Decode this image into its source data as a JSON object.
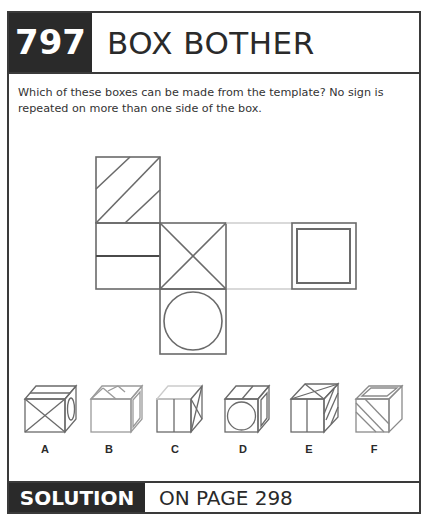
{
  "header": {
    "puzzle_number": "797",
    "title": "BOX BOTHER"
  },
  "question": "Which of these boxes can be made from the template? No sign is repeated on more than one side of the box.",
  "template": {
    "faces": [
      {
        "position": "top-left",
        "symbol": "diagonal-stripes"
      },
      {
        "position": "middle-left",
        "symbol": "horizontal-line"
      },
      {
        "position": "center",
        "symbol": "x-cross"
      },
      {
        "position": "middle-right",
        "symbol": "blank"
      },
      {
        "position": "far-right",
        "symbol": "double-square"
      },
      {
        "position": "bottom-center",
        "symbol": "circle"
      }
    ]
  },
  "options": [
    {
      "label": "A",
      "front": "x-cross",
      "top": "horizontal-line",
      "side": "circle"
    },
    {
      "label": "B",
      "front": "blank",
      "top": "diagonal-stripes",
      "side": "double-square"
    },
    {
      "label": "C",
      "front": "vertical-line",
      "top": "blank",
      "side": "x-cross"
    },
    {
      "label": "D",
      "front": "circle",
      "top": "line",
      "side": "double-square"
    },
    {
      "label": "E",
      "front": "vertical-line",
      "top": "x-cross",
      "side": "diagonal-stripes"
    },
    {
      "label": "F",
      "front": "diagonal-stripes",
      "top": "double-square",
      "side": "blank"
    }
  ],
  "footer": {
    "solution_label": "SOLUTION",
    "solution_text": "ON PAGE 298"
  },
  "colors": {
    "dark": "#2a2a2a",
    "line": "#6a6a6a",
    "faint": "#c8c8c8"
  }
}
